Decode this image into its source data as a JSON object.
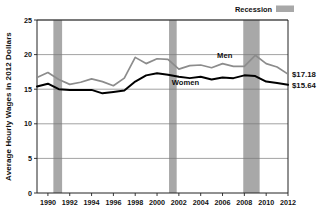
{
  "chart_data": {
    "type": "line",
    "title": "",
    "xlabel": "",
    "ylabel": "Average Hourly Wages in 2012 Dollars",
    "ylim": [
      0,
      25
    ],
    "xlim": [
      1989,
      2012
    ],
    "yticks": [
      "0",
      "5",
      "10",
      "15",
      "20",
      "25"
    ],
    "ytick_values": [
      0,
      5,
      10,
      15,
      20,
      25
    ],
    "xticks": [
      "1990",
      "1992",
      "1994",
      "1996",
      "1998",
      "2000",
      "2002",
      "2004",
      "2006",
      "2008",
      "2010",
      "2012"
    ],
    "xtick_values": [
      1990,
      1992,
      1994,
      1996,
      1998,
      2000,
      2002,
      2004,
      2006,
      2008,
      2010,
      2012
    ],
    "grid": "horizontal",
    "legend_position": "top-right",
    "x": [
      1989,
      1990,
      1991,
      1992,
      1993,
      1994,
      1995,
      1996,
      1997,
      1998,
      1999,
      2000,
      2001,
      2002,
      2003,
      2004,
      2005,
      2006,
      2007,
      2008,
      2009,
      2010,
      2011,
      2012
    ],
    "series": [
      {
        "name": "Men",
        "color": "#8c8c8c",
        "end_label": "$17.18",
        "values": [
          16.7,
          17.4,
          16.4,
          15.7,
          16.0,
          16.5,
          16.1,
          15.5,
          16.6,
          19.6,
          18.7,
          19.4,
          19.3,
          17.9,
          18.4,
          18.5,
          18.1,
          18.7,
          18.3,
          18.3,
          19.9,
          18.7,
          18.2,
          17.18
        ]
      },
      {
        "name": "Women",
        "color": "#000000",
        "end_label": "$15.64",
        "values": [
          15.4,
          15.8,
          15.0,
          14.9,
          14.9,
          14.9,
          14.4,
          14.6,
          14.8,
          16.1,
          17.0,
          17.3,
          17.1,
          16.8,
          16.6,
          16.8,
          16.4,
          16.7,
          16.6,
          17.0,
          16.9,
          16.1,
          15.9,
          15.64
        ]
      }
    ],
    "recessions": [
      {
        "label": "Recession",
        "start": 1990.5,
        "end": 1991.3
      },
      {
        "label": "Recession",
        "start": 2001.1,
        "end": 2001.8
      },
      {
        "label": "Recession",
        "start": 2007.9,
        "end": 2009.4
      }
    ],
    "legend": [
      {
        "label": "Recession",
        "color": "#a8a8a8",
        "swatch": "band"
      }
    ]
  }
}
